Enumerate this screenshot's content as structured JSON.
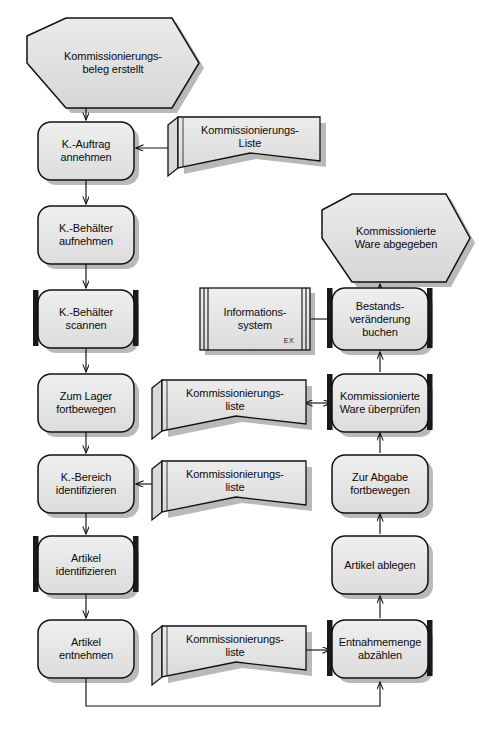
{
  "diagram": {
    "language": "de",
    "colors": {
      "node_fill": "#e2e2e2",
      "node_fill_light": "#ebebeb",
      "stroke": "#000000",
      "shadow": "#b4b4b4",
      "background": "#ffffff",
      "marker_bar": "#1a1a1a"
    },
    "nodes": [
      {
        "id": "ev_start",
        "type": "event-hexagon",
        "label": "Kommissionierungs-\nbeleg erstellt"
      },
      {
        "id": "p_auftrag",
        "type": "process",
        "label": "K.-Auftrag\nannehmen"
      },
      {
        "id": "p_behaelter_auf",
        "type": "process",
        "label": "K.-Behälter\naufnehmen"
      },
      {
        "id": "p_behaelter_scan",
        "type": "process-marked",
        "label": "K.-Behälter\nscannen"
      },
      {
        "id": "p_zum_lager",
        "type": "process",
        "label": "Zum Lager\nfortbewegen"
      },
      {
        "id": "p_bereich_ident",
        "type": "process",
        "label": "K.-Bereich\nidentifizieren"
      },
      {
        "id": "p_artikel_ident",
        "type": "process-marked",
        "label": "Artikel\nidentifizieren"
      },
      {
        "id": "p_artikel_entn",
        "type": "process",
        "label": "Artikel\nentnehmen"
      },
      {
        "id": "p_entnahme",
        "type": "process-marked",
        "label": "Entnahmemenge\nabzählen"
      },
      {
        "id": "p_artikel_ablegen",
        "type": "process",
        "label": "Artikel ablegen"
      },
      {
        "id": "p_zur_abgabe",
        "type": "process",
        "label": "Zur Abgabe\nfortbewegen"
      },
      {
        "id": "p_ware_pruefen",
        "type": "process-marked",
        "label": "Kommissionierte\nWare überprüfen"
      },
      {
        "id": "p_bestand_buchen",
        "type": "process-marked",
        "label": "Bestands-\nveränderung\nbuchen"
      },
      {
        "id": "ev_end",
        "type": "event-hexagon",
        "label": "Kommissionierte\nWare abgegeben"
      },
      {
        "id": "doc_liste_top",
        "type": "document",
        "label": "Kommissionierungs-\nListe"
      },
      {
        "id": "doc_liste_mid",
        "type": "document",
        "label": "Kommissionierungs-\nliste"
      },
      {
        "id": "doc_liste_low",
        "type": "document",
        "label": "Kommissionierungs-\nliste"
      },
      {
        "id": "doc_liste_bottom",
        "type": "document",
        "label": "Kommissionierungs-\nliste"
      },
      {
        "id": "sys_info",
        "type": "system",
        "label": "Informations-\nsystem",
        "badge": "EX"
      }
    ],
    "edges": [
      {
        "from": "ev_start",
        "to": "p_auftrag",
        "arrow": "single"
      },
      {
        "from": "doc_liste_top",
        "to": "p_auftrag",
        "arrow": "single"
      },
      {
        "from": "p_auftrag",
        "to": "p_behaelter_auf",
        "arrow": "single"
      },
      {
        "from": "p_behaelter_auf",
        "to": "p_behaelter_scan",
        "arrow": "single"
      },
      {
        "from": "p_behaelter_scan",
        "to": "p_zum_lager",
        "arrow": "single"
      },
      {
        "from": "p_zum_lager",
        "to": "p_bereich_ident",
        "arrow": "single"
      },
      {
        "from": "doc_liste_low",
        "to": "p_bereich_ident",
        "arrow": "single"
      },
      {
        "from": "p_bereich_ident",
        "to": "p_artikel_ident",
        "arrow": "single"
      },
      {
        "from": "p_artikel_ident",
        "to": "p_artikel_entn",
        "arrow": "single"
      },
      {
        "from": "p_artikel_entn",
        "to": "p_entnahme",
        "arrow": "single",
        "routing": "loop-bottom"
      },
      {
        "from": "doc_liste_bottom",
        "to": "p_entnahme",
        "arrow": "single"
      },
      {
        "from": "p_entnahme",
        "to": "p_artikel_ablegen",
        "arrow": "single"
      },
      {
        "from": "p_artikel_ablegen",
        "to": "p_zur_abgabe",
        "arrow": "single"
      },
      {
        "from": "p_zur_abgabe",
        "to": "p_ware_pruefen",
        "arrow": "single"
      },
      {
        "from": "p_ware_pruefen",
        "to": "doc_liste_mid",
        "arrow": "double"
      },
      {
        "from": "p_ware_pruefen",
        "to": "p_bestand_buchen",
        "arrow": "single"
      },
      {
        "from": "sys_info",
        "to": "p_bestand_buchen",
        "arrow": "none"
      },
      {
        "from": "p_bestand_buchen",
        "to": "ev_end",
        "arrow": "single"
      }
    ]
  }
}
